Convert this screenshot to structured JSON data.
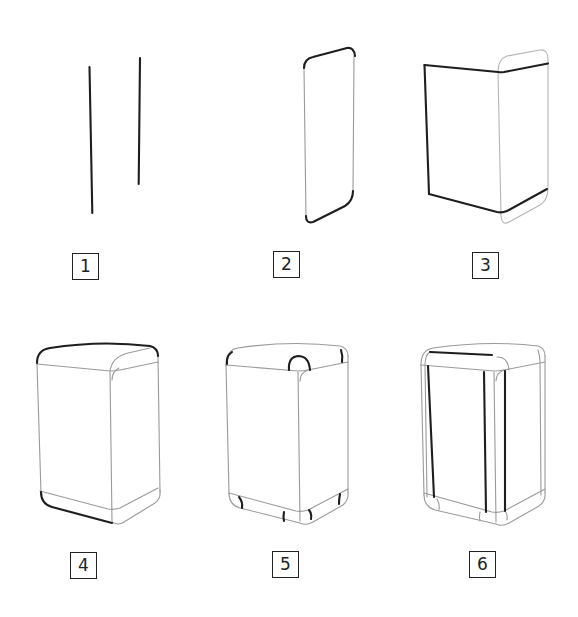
{
  "diagram": {
    "type": "step-by-step drawing tutorial",
    "colors": {
      "background": "#ffffff",
      "new_stroke": "#1e1e1e",
      "previous_stroke": "#9a9a9a",
      "label_border": "#222222"
    },
    "steps": [
      {
        "number": "1",
        "description": "Two vertical guide lines"
      },
      {
        "number": "2",
        "description": "Rounded side panel with bold top and bottom curves"
      },
      {
        "number": "3",
        "description": "Front face outline added beside side panel"
      },
      {
        "number": "4",
        "description": "Rounded top outline and bottom-left curve of full box"
      },
      {
        "number": "5",
        "description": "Corner rounding arcs at top and bottom corners"
      },
      {
        "number": "6",
        "description": "Inner frame edge lines on front and corner"
      }
    ]
  }
}
